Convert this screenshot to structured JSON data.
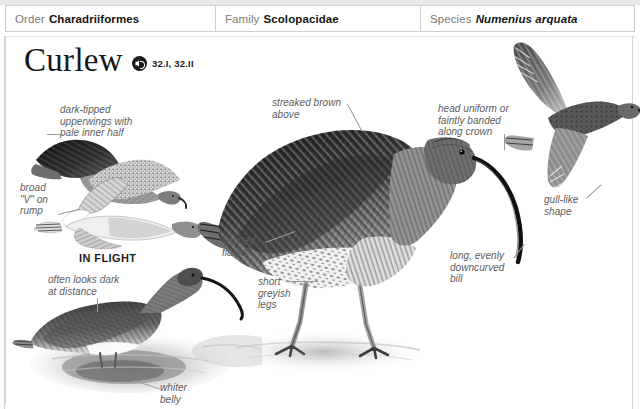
{
  "page": {
    "background_color": "#ffffff",
    "note_color": "#5c5c5c",
    "accent_color": "#1b1b1b"
  },
  "taxonomy": {
    "columns": [
      {
        "key": "Order",
        "value": "Charadriiformes",
        "italic": false
      },
      {
        "key": "Family",
        "value": "Scolopacidae",
        "italic": false
      },
      {
        "key": "Species",
        "value": "Numenius arquata",
        "italic": true
      }
    ]
  },
  "header": {
    "title": "Curlew",
    "audio_icon": "speaker-icon",
    "track_refs": "32.I, 32.II"
  },
  "captions": {
    "in_flight": "IN FLIGHT"
  },
  "annotations": [
    {
      "id": "dark-tipped-upperwings",
      "text": "dark-tipped\nupperwings with\npale inner half"
    },
    {
      "id": "broad-v-on-rump",
      "text": "broad\n\"V\" on\nrump"
    },
    {
      "id": "often-looks-dark",
      "text": "often looks dark\nat distance"
    },
    {
      "id": "whiter-belly",
      "text": "whiter\nbelly"
    },
    {
      "id": "streaked-brown-above",
      "text": "streaked brown\nabove"
    },
    {
      "id": "spotted-flanks",
      "text": "spotted\nflanks"
    },
    {
      "id": "short-greyish-legs",
      "text": "short\ngreyish\nlegs"
    },
    {
      "id": "head-uniform",
      "text": "head uniform or\nfaintly banded\nalong crown"
    },
    {
      "id": "gull-like-shape",
      "text": "gull-like\nshape"
    },
    {
      "id": "downcurved-bill",
      "text": "long, evenly\ndowncurved\nbill"
    }
  ],
  "illustrations": [
    {
      "id": "flying-curlew-upperwing",
      "label": "curlew in flight, upperwing view"
    },
    {
      "id": "flying-curlew-underside",
      "label": "curlew in flight, underside with white rump V"
    },
    {
      "id": "wading-curlew",
      "label": "curlew wading in shallow water with reflection"
    },
    {
      "id": "standing-curlew",
      "label": "curlew standing, main profile illustration"
    },
    {
      "id": "flying-curlew-gull-like",
      "label": "curlew in flight, gull-like silhouette"
    }
  ]
}
